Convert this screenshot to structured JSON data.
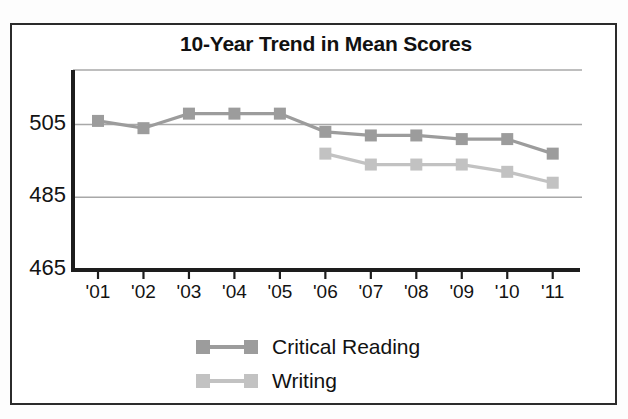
{
  "chart_data": {
    "type": "line",
    "title": "10-Year Trend in Mean Scores",
    "xlabel": "",
    "ylabel": "",
    "categories": [
      "'01",
      "'02",
      "'03",
      "'04",
      "'05",
      "'06",
      "'07",
      "'08",
      "'09",
      "'10",
      "'11"
    ],
    "ylim": [
      465,
      520
    ],
    "yticks": [
      465,
      485,
      505
    ],
    "ytick_labels": [
      "465",
      "485",
      "505"
    ],
    "grid": true,
    "gridlines_at": [
      485,
      505,
      520
    ],
    "legend_position": "bottom",
    "series": [
      {
        "name": "Critical Reading",
        "color": "#9c9c9c",
        "values": [
          506,
          504,
          508,
          508,
          508,
          503,
          502,
          502,
          501,
          501,
          497
        ]
      },
      {
        "name": "Writing",
        "color": "#c2c2c2",
        "values": [
          null,
          null,
          null,
          null,
          null,
          497,
          494,
          494,
          494,
          492,
          489
        ]
      }
    ]
  },
  "legend": {
    "items": [
      {
        "label": "Critical Reading",
        "color": "#9c9c9c"
      },
      {
        "label": "Writing",
        "color": "#c2c2c2"
      }
    ]
  },
  "colors": {
    "critical_reading": "#9c9c9c",
    "writing": "#c2c2c2",
    "axis": "#1d1d1d",
    "gridline": "#a8a8a8",
    "border": "#2b2b2b",
    "text": "#111111"
  }
}
